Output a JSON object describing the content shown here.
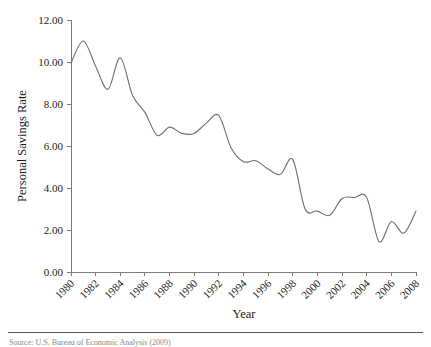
{
  "figure": {
    "background_color": "#ffffff",
    "line_color": "#6e6e6e",
    "axis_color": "#7a7a7a",
    "text_color": "#232323",
    "source_note": "Source: U.S. Bureau of Economic Analysis (2009)",
    "footer_rule_color": "#555555"
  },
  "chart_data": {
    "type": "line",
    "title": "",
    "xlabel": "Year",
    "ylabel": "Personal Savings Rate",
    "xlim": [
      1980,
      2008
    ],
    "ylim": [
      0,
      12
    ],
    "ytick_values": [
      0,
      2,
      4,
      6,
      8,
      10,
      12
    ],
    "ytick_labels": [
      "0.00",
      "2.00",
      "4.00",
      "6.00",
      "8.00",
      "10.00",
      "12.00"
    ],
    "xtick_values": [
      1980,
      1982,
      1984,
      1986,
      1988,
      1990,
      1992,
      1994,
      1996,
      1998,
      2000,
      2002,
      2004,
      2006,
      2008
    ],
    "xtick_labels": [
      "1980",
      "1982",
      "1984",
      "1986",
      "1988",
      "1990",
      "1992",
      "1994",
      "1996",
      "1998",
      "2000",
      "2002",
      "2004",
      "2006",
      "2008"
    ],
    "xtick_label_rotation_deg": 45,
    "grid": false,
    "legend": false,
    "series": [
      {
        "name": "Personal Savings Rate",
        "x": [
          1980,
          1981,
          1982,
          1983,
          1984,
          1985,
          1986,
          1987,
          1988,
          1989,
          1990,
          1991,
          1992,
          1993,
          1994,
          1995,
          1996,
          1997,
          1998,
          1999,
          2000,
          2001,
          2002,
          2003,
          2004,
          2005,
          2006,
          2007,
          2008
        ],
        "values": [
          9.95,
          11.0,
          9.8,
          8.7,
          10.2,
          8.4,
          7.6,
          6.5,
          6.9,
          6.6,
          6.6,
          7.1,
          7.45,
          5.9,
          5.25,
          5.3,
          4.9,
          4.65,
          5.35,
          3.0,
          2.9,
          2.7,
          3.5,
          3.55,
          3.55,
          1.45,
          2.4,
          1.85,
          2.9
        ]
      }
    ]
  }
}
